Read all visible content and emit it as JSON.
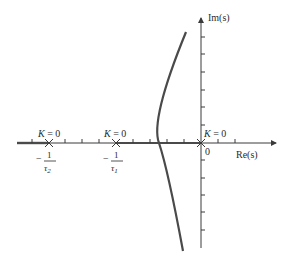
{
  "diagram": {
    "type": "root-locus",
    "axes": {
      "real_label": "Re(s)",
      "imag_label": "Im(s)",
      "origin_label": "0"
    },
    "poles": [
      {
        "id": "p2",
        "label_num": "1",
        "label_den": "τ2",
        "sign": "−",
        "k_label": "K = 0",
        "x": 49
      },
      {
        "id": "p1",
        "label_num": "1",
        "label_den": "τ1",
        "sign": "−",
        "k_label": "K = 0",
        "x": 116
      },
      {
        "id": "p0",
        "label": "0",
        "k_label": "K = 0",
        "x": 201
      }
    ],
    "colors": {
      "axis": "#3a3a3a",
      "locus": "#4a4a4a",
      "text": "#2a2a2a"
    }
  }
}
